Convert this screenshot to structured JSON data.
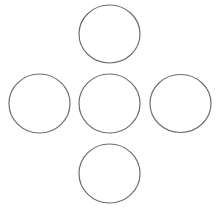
{
  "diagram": {
    "background": "#ffffff",
    "stroke_color": "#6e6e6e",
    "stroke_width": 1.2,
    "circles": [
      {
        "id": "top",
        "cx": 109.5,
        "cy": 34,
        "rx": 30.5,
        "ry": 29
      },
      {
        "id": "left",
        "cx": 39.5,
        "cy": 103.5,
        "rx": 30.5,
        "ry": 29.5
      },
      {
        "id": "center",
        "cx": 109.5,
        "cy": 103.5,
        "rx": 30.5,
        "ry": 29.5
      },
      {
        "id": "right",
        "cx": 180.5,
        "cy": 103.5,
        "rx": 30.5,
        "ry": 29
      },
      {
        "id": "bottom",
        "cx": 109.5,
        "cy": 173.5,
        "rx": 30.5,
        "ry": 29.5
      }
    ]
  }
}
